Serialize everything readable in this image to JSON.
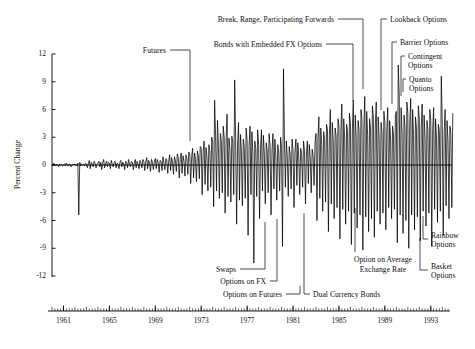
{
  "chart_data": {
    "type": "line",
    "title": "",
    "xlabel": "",
    "ylabel": "Percent Change",
    "ylim": [
      -12,
      12
    ],
    "xlim": [
      1960.0,
      1994.5
    ],
    "grid": false,
    "legend": "none",
    "yticks": [
      "12",
      "9",
      "6",
      "3",
      "0",
      "-3",
      "-6",
      "-9",
      "-12"
    ],
    "ytick_values": [
      12,
      9,
      6,
      3,
      0,
      -3,
      -6,
      -9,
      -12
    ],
    "xticks": [
      "1961",
      "1965",
      "1969",
      "1973",
      "1977",
      "1981",
      "1985",
      "1989",
      "1993"
    ],
    "xtick_values": [
      1961,
      1965,
      1969,
      1973,
      1977,
      1981,
      1985,
      1989,
      1993
    ],
    "series": [
      {
        "name": "Percent Change in Exchange Rate",
        "x_start": 1960.0,
        "x_step": 0.0833333,
        "values": [
          0.1,
          -0.1,
          0.2,
          0.0,
          -0.1,
          0.1,
          0.0,
          -0.2,
          0.1,
          0.0,
          0.1,
          -0.1,
          0.0,
          0.1,
          -0.1,
          0.2,
          0.0,
          -0.1,
          0.1,
          0.1,
          -0.2,
          0.0,
          0.1,
          0.0,
          0.1,
          -0.1,
          0.0,
          0.2,
          -5.4,
          0.3,
          -0.1,
          0.1,
          0.0,
          0.1,
          -0.1,
          0.2,
          0.1,
          -0.3,
          0.2,
          0.5,
          -0.4,
          0.3,
          0.1,
          -0.2,
          0.4,
          0.2,
          -0.3,
          0.1,
          0.2,
          0.4,
          -0.2,
          0.3,
          -0.5,
          0.2,
          0.6,
          -0.3,
          0.1,
          0.4,
          -0.2,
          0.3,
          0.2,
          -0.4,
          0.5,
          0.1,
          -0.2,
          0.3,
          0.4,
          -0.3,
          0.2,
          0.1,
          -0.4,
          0.3,
          0.5,
          -0.2,
          0.3,
          0.1,
          -0.5,
          0.4,
          0.2,
          -0.3,
          0.6,
          0.1,
          -0.2,
          0.4,
          0.3,
          -0.5,
          0.2,
          0.6,
          -0.3,
          0.4,
          0.1,
          -0.4,
          0.5,
          0.2,
          -0.3,
          0.6,
          0.4,
          -0.6,
          0.3,
          0.8,
          -0.4,
          0.5,
          0.2,
          -0.7,
          0.6,
          0.3,
          -0.5,
          0.4,
          0.7,
          -0.4,
          0.6,
          0.3,
          -0.8,
          0.5,
          0.4,
          -0.6,
          0.9,
          0.2,
          -0.5,
          0.7,
          0.6,
          -0.9,
          0.4,
          1.1,
          -0.6,
          0.8,
          0.3,
          -1.0,
          0.9,
          0.5,
          -0.7,
          1.2,
          0.8,
          -1.4,
          0.6,
          1.3,
          -0.9,
          1.0,
          0.4,
          -1.2,
          1.1,
          0.7,
          -1.0,
          1.4,
          1.2,
          -2.0,
          0.9,
          1.8,
          -1.4,
          1.3,
          0.6,
          -1.8,
          1.5,
          1.0,
          -1.5,
          2.0,
          1.8,
          -3.2,
          1.4,
          2.6,
          -2.1,
          1.9,
          0.9,
          -2.8,
          2.2,
          1.5,
          -2.4,
          3.0,
          2.4,
          -4.5,
          7.0,
          3.2,
          -2.8,
          4.8,
          2.1,
          -3.6,
          3.4,
          2.6,
          -3.0,
          4.2,
          3.0,
          -5.2,
          2.6,
          5.5,
          -3.4,
          2.9,
          1.8,
          -4.0,
          3.1,
          2.4,
          -3.2,
          9.2,
          2.8,
          -6.4,
          2.2,
          4.6,
          -3.8,
          3.3,
          1.6,
          -4.4,
          2.8,
          2.0,
          -3.6,
          4.0,
          2.5,
          -7.6,
          2.0,
          4.2,
          -3.2,
          3.6,
          1.4,
          -10.6,
          2.6,
          1.8,
          -3.4,
          3.8,
          2.2,
          -5.8,
          1.8,
          3.8,
          -2.8,
          3.2,
          1.2,
          -4.2,
          2.4,
          1.6,
          -3.0,
          3.4,
          2.0,
          -5.4,
          1.6,
          3.4,
          -2.6,
          2.8,
          1.0,
          -3.8,
          2.2,
          1.4,
          -2.8,
          3.0,
          1.8,
          -8.8,
          10.4,
          3.0,
          -2.4,
          2.6,
          0.9,
          -3.4,
          2.0,
          1.2,
          -2.6,
          2.8,
          1.6,
          -4.6,
          1.4,
          2.8,
          -2.2,
          2.4,
          0.8,
          -3.2,
          1.8,
          1.1,
          -2.4,
          2.6,
          1.5,
          -4.2,
          1.3,
          2.6,
          -2.0,
          2.2,
          0.7,
          -3.0,
          1.7,
          1.0,
          -2.2,
          2.4,
          3.4,
          -6.0,
          2.8,
          5.2,
          -3.6,
          4.0,
          2.2,
          -5.0,
          3.6,
          2.8,
          -4.0,
          4.4,
          3.8,
          -7.2,
          3.2,
          6.0,
          -4.2,
          4.6,
          2.6,
          -5.8,
          4.0,
          3.2,
          -4.6,
          5.0,
          4.2,
          -8.0,
          3.6,
          6.6,
          -4.8,
          5.0,
          2.8,
          -6.4,
          4.4,
          3.6,
          -5.0,
          5.6,
          4.6,
          -8.6,
          3.8,
          7.0,
          -5.2,
          5.4,
          3.0,
          -6.8,
          4.8,
          3.8,
          -5.4,
          6.0,
          5.0,
          -9.2,
          4.0,
          7.4,
          -5.6,
          5.8,
          3.2,
          -7.2,
          5.0,
          4.0,
          -5.8,
          6.4,
          5.2,
          -7.8,
          4.2,
          6.8,
          -5.0,
          5.2,
          3.0,
          -6.4,
          4.6,
          3.6,
          -5.2,
          5.8,
          4.6,
          -7.0,
          3.8,
          6.2,
          -4.6,
          4.8,
          2.8,
          -5.8,
          4.2,
          3.4,
          -4.8,
          5.4,
          5.8,
          -8.4,
          10.8,
          7.6,
          -5.4,
          6.2,
          3.4,
          -7.4,
          5.4,
          4.2,
          -6.0,
          6.8,
          5.6,
          -9.0,
          4.4,
          7.2,
          -5.4,
          6.0,
          3.2,
          -7.0,
          5.2,
          4.0,
          -5.6,
          6.4,
          5.0,
          -8.2,
          4.0,
          6.6,
          -5.0,
          5.4,
          3.0,
          -6.6,
          4.8,
          3.8,
          -5.2,
          6.0,
          4.8,
          -8.8,
          3.8,
          6.2,
          -4.8,
          5.0,
          2.8,
          -6.2,
          4.4,
          3.6,
          -5.0,
          9.6,
          4.4,
          -7.6,
          3.6,
          6.0,
          -4.4,
          4.8,
          2.6,
          -5.8,
          4.2,
          3.4,
          -4.6,
          5.6
        ]
      }
    ],
    "annotations": [
      {
        "id": "futures",
        "label": "Futures",
        "side": "left-top"
      },
      {
        "id": "bonds-embedded-fx",
        "label": "Bonds with Embedded FX Options",
        "side": "left-top"
      },
      {
        "id": "break-range-participating-forwards",
        "label": "Break, Range, Participating Forwards",
        "side": "left-top"
      },
      {
        "id": "lookback-options",
        "label": "Lookback Options",
        "side": "right-top"
      },
      {
        "id": "barrier-options",
        "label": "Barrier Options",
        "side": "right-top"
      },
      {
        "id": "contingent-options",
        "label": "Contingent Options",
        "side": "right-top"
      },
      {
        "id": "quanto-options",
        "label": "Quanto Options",
        "side": "right-top"
      },
      {
        "id": "swaps",
        "label": "Swaps",
        "side": "left-bottom"
      },
      {
        "id": "options-on-fx",
        "label": "Options on FX",
        "side": "left-bottom"
      },
      {
        "id": "options-on-futures",
        "label": "Options on Futures",
        "side": "left-bottom"
      },
      {
        "id": "dual-currency-bonds",
        "label": "Dual Currency Bonds",
        "side": "right-bottom"
      },
      {
        "id": "option-on-average-exchange-rate",
        "label": "Option on Average Exchange Rate",
        "side": "right-bottom"
      },
      {
        "id": "rainbow-options",
        "label": "Rainbow Options",
        "side": "right-bottom"
      },
      {
        "id": "basket-options",
        "label": "Basket Options",
        "side": "right-bottom"
      }
    ]
  },
  "annotations_text": {
    "futures": "Futures",
    "bonds_embedded_fx": "Bonds with Embedded FX Options",
    "break_range_forwards": "Break, Range, Participating Forwards",
    "lookback_options": "Lookback Options",
    "barrier_options": "Barrier Options",
    "contingent_options_l1": "Contingent",
    "contingent_options_l2": "Options",
    "quanto_options_l1": "Quanto",
    "quanto_options_l2": "Options",
    "swaps": "Swaps",
    "options_on_fx": "Options on FX",
    "options_on_futures": "Options on Futures",
    "dual_currency_bonds": "Dual Currency Bonds",
    "option_avg_rate_l1": "Option on Average",
    "option_avg_rate_l2": "Exchange Rate",
    "rainbow_options_l1": "Rainbow",
    "rainbow_options_l2": "Options",
    "basket_options_l1": "Basket",
    "basket_options_l2": "Options"
  },
  "axes": {
    "ylabel": "Percent Change",
    "yticks": [
      "12",
      "9",
      "6",
      "3",
      "0",
      "-3",
      "-6",
      "-9",
      "-12"
    ],
    "xticks": [
      "1961",
      "1965",
      "1969",
      "1973",
      "1977",
      "1981",
      "1985",
      "1989",
      "1993"
    ]
  },
  "colors": {
    "line": "#000000",
    "axis": "#000000",
    "background": "#ffffff",
    "text": "#111111"
  }
}
